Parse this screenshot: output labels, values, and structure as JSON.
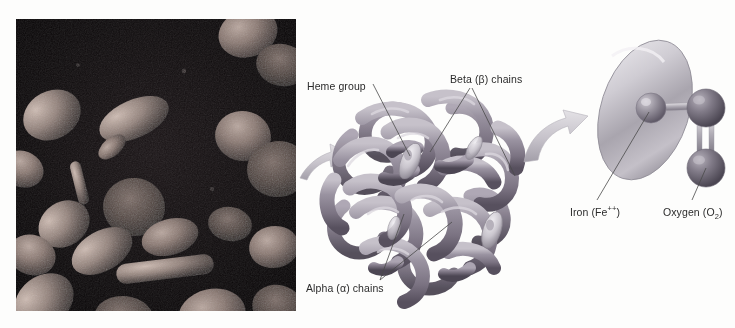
{
  "figure": {
    "background_color": "#fdfdfc"
  },
  "micrograph": {
    "name": "red-blood-cells-electron-micrograph",
    "description": "Scanning electron micrograph of red blood cells",
    "background_color": "#090608",
    "cell_color": "#8c7a74",
    "frame": {
      "x": 16,
      "y": 19,
      "width": 280,
      "height": 292
    }
  },
  "labels": {
    "heme_group": "Heme group",
    "beta_chains": "Beta (β) chains",
    "alpha_chains": "Alpha (α) chains",
    "iron_prefix": "Iron (Fe",
    "iron_charge": "++",
    "iron_suffix": ")",
    "oxygen_prefix": "Oxygen (O",
    "oxygen_subscript": "2",
    "oxygen_suffix": ")"
  },
  "molecule": {
    "name": "hemoglobin-quaternary-structure",
    "ribbon_color": "#8b8490",
    "ribbon_shadow": "#5f5a66",
    "ribbon_highlight": "#c3bec7",
    "heme_disc_color": "#cfcbd2",
    "heme_count": 4,
    "chain_count": 4
  },
  "heme_detail": {
    "name": "heme-plate-with-iron-and-oxygen",
    "plate_color": "#b9b6bd",
    "plate_highlight": "#e8e6ea",
    "iron_color": "#8e8a92",
    "oxygen_color": "#6f6b74",
    "bond_color": "#a9a5ad",
    "oxygen_bond_type": "double"
  },
  "arrows": {
    "photo_to_molecule": "curved-arrow-right",
    "molecule_to_heme": "curved-arrow-up-right",
    "color": "#cbc8ce"
  },
  "colors": {
    "text": "#2b2b2b",
    "leader_line": "#4a4a4a"
  }
}
